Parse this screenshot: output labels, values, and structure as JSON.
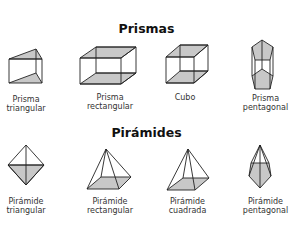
{
  "sections": {
    "prisms": {
      "title": "Prismas",
      "items": [
        {
          "label_line1": "Prisma",
          "label_line2": "triangular",
          "shape": "triangular-prism"
        },
        {
          "label_line1": "Prisma",
          "label_line2": "rectangular",
          "shape": "rectangular-prism"
        },
        {
          "label_line1": "Cubo",
          "label_line2": "",
          "shape": "cube"
        },
        {
          "label_line1": "Prisma",
          "label_line2": "pentagonal",
          "shape": "pentagonal-prism"
        }
      ]
    },
    "pyramids": {
      "title": "Pirámides",
      "items": [
        {
          "label_line1": "Pirámide",
          "label_line2": "triangular",
          "shape": "triangular-pyramid"
        },
        {
          "label_line1": "Pirámide",
          "label_line2": "rectangular",
          "shape": "rectangular-pyramid"
        },
        {
          "label_line1": "Pirámide",
          "label_line2": "cuadrada",
          "shape": "square-pyramid"
        },
        {
          "label_line1": "Pirámide",
          "label_line2": "pentagonal",
          "shape": "pentagonal-pyramid"
        }
      ]
    }
  },
  "colors": {
    "face_fill": "#c8c8c8",
    "edge": "#222222",
    "background": "#ffffff"
  }
}
